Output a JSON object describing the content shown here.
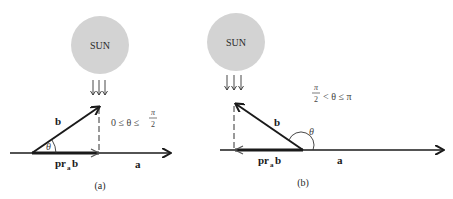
{
  "figure": {
    "panels": [
      {
        "id": "a",
        "caption": "(a)",
        "sun_label": "SUN",
        "vector_b_label": "b",
        "vector_a_label": "a",
        "projection_label_main": "pr",
        "projection_label_sub": "a",
        "projection_label_tail": "b",
        "angle_label": "θ",
        "condition": {
          "left": "0 ≤ θ ≤",
          "frac_num": "π",
          "frac_den": "2"
        }
      },
      {
        "id": "b",
        "caption": "(b)",
        "sun_label": "SUN",
        "vector_b_label": "b",
        "vector_a_label": "a",
        "projection_label_main": "pr",
        "projection_label_sub": "a",
        "projection_label_tail": "b",
        "angle_label": "θ",
        "condition": {
          "frac_num": "π",
          "frac_den": "2",
          "right": "< θ ≤ π"
        }
      }
    ],
    "colors": {
      "sun_fill": "#d3d3d3",
      "ink": "#1a1a1a",
      "background": "#ffffff"
    }
  }
}
